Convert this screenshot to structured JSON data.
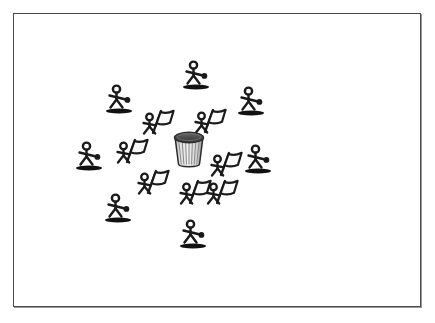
{
  "scene": {
    "title": "Stick figures gathered around a drum",
    "background_color": "#ffffff",
    "border_color": "#4a4a4a",
    "ink_color": "#1a1a1a",
    "shadow_color": "#111111",
    "drum_body_color": "#d8d8d8",
    "drum_lid_color": "#4f4f4f",
    "drum_stave_color": "#8a8a8a"
  },
  "frame": {
    "name": "picture-frame",
    "x": 13,
    "y": 13,
    "width": 408,
    "height": 294
  },
  "drum": {
    "name": "drum",
    "label": "drum",
    "x": 173,
    "y": 131,
    "width": 32,
    "height": 40
  },
  "standing_figures": [
    {
      "id": "figure-n",
      "label": "standing figure north",
      "x": 196,
      "y": 62,
      "flip": false
    },
    {
      "id": "figure-nw",
      "label": "standing figure north-west",
      "x": 119,
      "y": 86,
      "flip": false
    },
    {
      "id": "figure-ne",
      "label": "standing figure north-east",
      "x": 251,
      "y": 88,
      "flip": false
    },
    {
      "id": "figure-w",
      "label": "standing figure west",
      "x": 89,
      "y": 143,
      "flip": false
    },
    {
      "id": "figure-e",
      "label": "standing figure east",
      "x": 258,
      "y": 146,
      "flip": false
    },
    {
      "id": "figure-sw",
      "label": "standing figure south-west",
      "x": 118,
      "y": 195,
      "flip": false
    },
    {
      "id": "figure-s",
      "label": "standing figure south",
      "x": 193,
      "y": 221,
      "flip": false
    }
  ],
  "flag_bearers": [
    {
      "id": "flag-nw",
      "label": "flag bearer north-west",
      "x": 155,
      "y": 114
    },
    {
      "id": "flag-ne",
      "label": "flag bearer north-east",
      "x": 207,
      "y": 113
    },
    {
      "id": "flag-w",
      "label": "flag bearer west",
      "x": 129,
      "y": 143
    },
    {
      "id": "flag-e",
      "label": "flag bearer east",
      "x": 223,
      "y": 156
    },
    {
      "id": "flag-sw",
      "label": "flag bearer south-west",
      "x": 150,
      "y": 174
    },
    {
      "id": "flag-s1",
      "label": "flag bearer south",
      "x": 192,
      "y": 184
    },
    {
      "id": "flag-s2",
      "label": "flag bearer south-east",
      "x": 219,
      "y": 184
    }
  ]
}
